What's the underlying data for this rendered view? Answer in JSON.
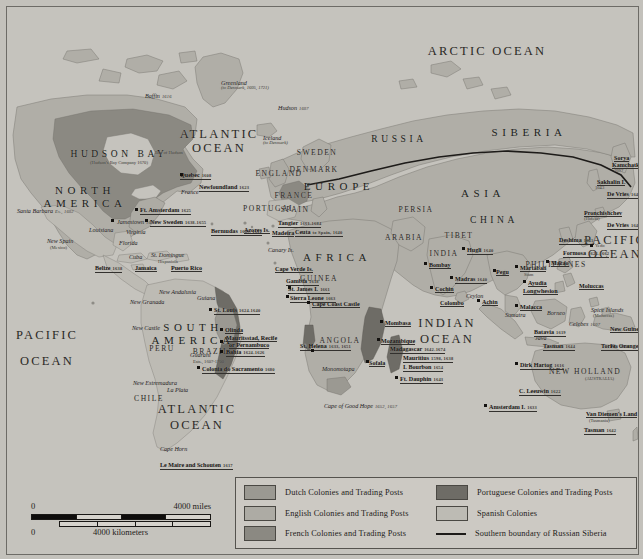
{
  "map": {
    "title": "European Colonies and Trading Posts c. 1700",
    "oceans": [
      {
        "name": "ARCTIC OCEAN",
        "x": 480,
        "y": 38,
        "size": "lg"
      },
      {
        "name": "ATLANTIC",
        "x": 212,
        "y": 121,
        "size": "lg"
      },
      {
        "name": "OCEAN",
        "x": 212,
        "y": 135,
        "size": "lg"
      },
      {
        "name": "PACIFIC",
        "x": 40,
        "y": 322,
        "size": "lg"
      },
      {
        "name": "OCEAN",
        "x": 40,
        "y": 348,
        "size": "lg"
      },
      {
        "name": "ATLANTIC",
        "x": 190,
        "y": 396,
        "size": "lg"
      },
      {
        "name": "OCEAN",
        "x": 190,
        "y": 412,
        "size": "lg"
      },
      {
        "name": "INDIAN",
        "x": 440,
        "y": 310,
        "size": "lg"
      },
      {
        "name": "OCEAN",
        "x": 440,
        "y": 326,
        "size": "lg"
      },
      {
        "name": "PACIFIC",
        "x": 608,
        "y": 227,
        "size": "lg"
      },
      {
        "name": "OCEAN",
        "x": 608,
        "y": 241,
        "size": "lg"
      }
    ],
    "continents": [
      {
        "name": "NORTH",
        "x": 78,
        "y": 178
      },
      {
        "name": "AMERICA",
        "x": 78,
        "y": 191
      },
      {
        "name": "SOUTH",
        "x": 186,
        "y": 315
      },
      {
        "name": "AMERICA",
        "x": 186,
        "y": 328
      },
      {
        "name": "AFRICA",
        "x": 330,
        "y": 245
      },
      {
        "name": "EUROPE",
        "x": 332,
        "y": 174
      },
      {
        "name": "ASIA",
        "x": 476,
        "y": 181
      },
      {
        "name": "SIBERIA",
        "x": 522,
        "y": 120
      },
      {
        "name": "CHINA",
        "x": 487,
        "y": 209
      },
      {
        "name": "RUSSIA",
        "x": 392,
        "y": 128
      },
      {
        "name": "HUDSON BAY",
        "x": 112,
        "y": 143
      }
    ],
    "regions": [
      {
        "name": "GUINEA",
        "x": 312,
        "y": 268
      },
      {
        "name": "ANGOLA",
        "x": 333,
        "y": 330
      },
      {
        "name": "ARABIA",
        "x": 397,
        "y": 227
      },
      {
        "name": "PERSIA",
        "x": 409,
        "y": 199
      },
      {
        "name": "INDIA",
        "x": 437,
        "y": 243
      },
      {
        "name": "PERU",
        "x": 155,
        "y": 338
      },
      {
        "name": "CHILE",
        "x": 142,
        "y": 388
      },
      {
        "name": "BRAZIL",
        "x": 204,
        "y": 341
      },
      {
        "name": "PHILIPPINES",
        "x": 549,
        "y": 254
      },
      {
        "name": "SWEDEN",
        "x": 310,
        "y": 142
      },
      {
        "name": "DENMARK",
        "x": 307,
        "y": 159
      },
      {
        "name": "ENGLAND",
        "x": 272,
        "y": 163
      },
      {
        "name": "FRANCE",
        "x": 287,
        "y": 185
      },
      {
        "name": "SPAIN",
        "x": 288,
        "y": 199
      },
      {
        "name": "PORTUGAL",
        "x": 262,
        "y": 198
      },
      {
        "name": "NEW HOLLAND",
        "x": 578,
        "y": 361
      },
      {
        "name": "TIBET",
        "x": 452,
        "y": 225
      }
    ],
    "places": [
      {
        "name": "Greenland",
        "x": 214,
        "y": 73,
        "type": "i",
        "sub": "(to Denmark, 1605, 1721)"
      },
      {
        "name": "Iceland",
        "x": 256,
        "y": 128,
        "type": "i",
        "sub": "(to Denmark)"
      },
      {
        "name": "Bay of Hudson",
        "x": 148,
        "y": 144,
        "type": "sub"
      },
      {
        "name": "Hudson",
        "x": 271,
        "y": 98,
        "type": "i",
        "date": "1607"
      },
      {
        "name": "Baffin",
        "x": 138,
        "y": 86,
        "type": "i",
        "date": "1616"
      },
      {
        "name": "Quebec",
        "x": 173,
        "y": 165,
        "type": "b",
        "date": "1608"
      },
      {
        "name": "France",
        "x": 174,
        "y": 182,
        "type": "i"
      },
      {
        "name": "Newfoundland",
        "x": 192,
        "y": 177,
        "type": "b",
        "date": "1623"
      },
      {
        "name": "Ft. Amsterdam",
        "x": 133,
        "y": 200,
        "type": "b",
        "date": "1625"
      },
      {
        "name": "New Sweden",
        "x": 143,
        "y": 212,
        "type": "b",
        "date": "1638-1655"
      },
      {
        "name": "Jamestown",
        "x": 110,
        "y": 212,
        "type": "i",
        "date": "1607"
      },
      {
        "name": "Virginia",
        "x": 119,
        "y": 222,
        "type": "i"
      },
      {
        "name": "Louisiana",
        "x": 82,
        "y": 220,
        "type": "i"
      },
      {
        "name": "Bermudas",
        "x": 204,
        "y": 221,
        "type": "b",
        "date": "1609, 1612"
      },
      {
        "name": "Azores Is.",
        "x": 237,
        "y": 220,
        "type": "b"
      },
      {
        "name": "Tangier",
        "x": 271,
        "y": 213,
        "type": "b",
        "date": "1661-1684"
      },
      {
        "name": "Madeira",
        "x": 265,
        "y": 223,
        "type": "b"
      },
      {
        "name": "Ceuta",
        "x": 288,
        "y": 222,
        "type": "b",
        "date": "to Spain, 1640"
      },
      {
        "name": "Canary Is.",
        "x": 261,
        "y": 240,
        "type": "i"
      },
      {
        "name": "Cape Verde Is.",
        "x": 268,
        "y": 259,
        "type": "b"
      },
      {
        "name": "Gambia",
        "x": 279,
        "y": 271,
        "type": "b",
        "date": "1618"
      },
      {
        "name": "St. James I.",
        "x": 281,
        "y": 279,
        "type": "b",
        "date": "1661"
      },
      {
        "name": "Sierra Leone",
        "x": 283,
        "y": 288,
        "type": "b",
        "date": "1663"
      },
      {
        "name": "Cape Coast Castle",
        "x": 305,
        "y": 294,
        "type": "b"
      },
      {
        "name": "Santa Barbara",
        "x": 10,
        "y": 201,
        "type": "i",
        "date": "Es., 1602"
      },
      {
        "name": "New Spain",
        "x": 40,
        "y": 231,
        "type": "i"
      },
      {
        "name": "(Mexico)",
        "x": 43,
        "y": 239,
        "type": "sub"
      },
      {
        "name": "Florida",
        "x": 112,
        "y": 233,
        "type": "i"
      },
      {
        "name": "Cuba",
        "x": 122,
        "y": 247,
        "type": "i"
      },
      {
        "name": "St. Domingue",
        "x": 144,
        "y": 245,
        "type": "i"
      },
      {
        "name": "Hispaniola",
        "x": 151,
        "y": 253,
        "type": "sub"
      },
      {
        "name": "Belize",
        "x": 88,
        "y": 258,
        "type": "b",
        "date": "1638"
      },
      {
        "name": "Jamaica",
        "x": 128,
        "y": 258,
        "type": "b"
      },
      {
        "name": "Puerto Rico",
        "x": 164,
        "y": 258,
        "type": "b"
      },
      {
        "name": "New Granada",
        "x": 123,
        "y": 292,
        "type": "i"
      },
      {
        "name": "New Andalusia",
        "x": 152,
        "y": 282,
        "type": "i"
      },
      {
        "name": "Guiana",
        "x": 190,
        "y": 288,
        "type": "i"
      },
      {
        "name": "New Castle",
        "x": 125,
        "y": 318,
        "type": "i"
      },
      {
        "name": "St. Louis",
        "x": 207,
        "y": 300,
        "type": "b",
        "date": "1624-1640"
      },
      {
        "name": "Olinda",
        "x": 218,
        "y": 320,
        "type": "b"
      },
      {
        "name": "Mauritsstad, Recife",
        "x": 219,
        "y": 328,
        "type": "b"
      },
      {
        "name": "or Pernambuco",
        "x": 222,
        "y": 335,
        "type": "b"
      },
      {
        "name": "Bahia",
        "x": 219,
        "y": 342,
        "type": "b",
        "date": "1624-1626"
      },
      {
        "name": "Colonia do Sacramento",
        "x": 195,
        "y": 359,
        "type": "b",
        "date": "1680"
      },
      {
        "name": "Guarani",
        "x": 183,
        "y": 345,
        "type": "i"
      },
      {
        "name": "Ests., 1607-1700",
        "x": 186,
        "y": 353,
        "type": "sub"
      },
      {
        "name": "La Plata",
        "x": 160,
        "y": 380,
        "type": "i"
      },
      {
        "name": "New Estremadura",
        "x": 126,
        "y": 373,
        "type": "i"
      },
      {
        "name": "Cape Horn",
        "x": 153,
        "y": 439,
        "type": "i"
      },
      {
        "name": "Le Maire and Schouten",
        "x": 153,
        "y": 455,
        "type": "b",
        "date": "1617"
      },
      {
        "name": "St. Helena",
        "x": 293,
        "y": 336,
        "type": "b",
        "date": "1633, 1651"
      },
      {
        "name": "Cape of Good Hope",
        "x": 317,
        "y": 396,
        "type": "i",
        "date": "1652, 1657"
      },
      {
        "name": "Monomotapa",
        "x": 315,
        "y": 359,
        "type": "i"
      },
      {
        "name": "Mombasa",
        "x": 378,
        "y": 313,
        "type": "b"
      },
      {
        "name": "Mozambique",
        "x": 374,
        "y": 331,
        "type": "b"
      },
      {
        "name": "Madagascar",
        "x": 383,
        "y": 339,
        "type": "b",
        "date": "1642-1674"
      },
      {
        "name": "Sofala",
        "x": 362,
        "y": 353,
        "type": "b"
      },
      {
        "name": "Mauritius",
        "x": 396,
        "y": 348,
        "type": "b",
        "date": "1598, 1638"
      },
      {
        "name": "I. Bourbon",
        "x": 396,
        "y": 357,
        "type": "b",
        "date": "1654"
      },
      {
        "name": "Ft. Dauphin",
        "x": 393,
        "y": 369,
        "type": "b",
        "date": "1643"
      },
      {
        "name": "Bombay",
        "x": 422,
        "y": 255,
        "type": "b"
      },
      {
        "name": "Hugli",
        "x": 460,
        "y": 240,
        "type": "b",
        "date": "1640"
      },
      {
        "name": "Madras",
        "x": 448,
        "y": 269,
        "type": "b",
        "date": "1640"
      },
      {
        "name": "Cochin",
        "x": 428,
        "y": 279,
        "type": "b"
      },
      {
        "name": "Colombo",
        "x": 433,
        "y": 293,
        "type": "b"
      },
      {
        "name": "Ceylon",
        "x": 459,
        "y": 286,
        "type": "i"
      },
      {
        "name": "Achin",
        "x": 475,
        "y": 292,
        "type": "b"
      },
      {
        "name": "Sumatra",
        "x": 498,
        "y": 305,
        "type": "i"
      },
      {
        "name": "Malacca",
        "x": 513,
        "y": 297,
        "type": "b"
      },
      {
        "name": "Borneo",
        "x": 540,
        "y": 303,
        "type": "i"
      },
      {
        "name": "Celebes",
        "x": 562,
        "y": 314,
        "type": "i",
        "date": "1607"
      },
      {
        "name": "Java",
        "x": 528,
        "y": 328,
        "type": "i"
      },
      {
        "name": "Batavia",
        "x": 527,
        "y": 322,
        "type": "b",
        "date": "1619"
      },
      {
        "name": "Spice Islands",
        "x": 584,
        "y": 300,
        "type": "i"
      },
      {
        "name": "(Moluccas)",
        "x": 586,
        "y": 307,
        "type": "sub"
      },
      {
        "name": "Moluccas",
        "x": 572,
        "y": 276,
        "type": "b"
      },
      {
        "name": "Pegu",
        "x": 489,
        "y": 262,
        "type": "b"
      },
      {
        "name": "Martaban",
        "x": 513,
        "y": 258,
        "type": "b"
      },
      {
        "name": "Siam",
        "x": 517,
        "y": 266,
        "type": "sub"
      },
      {
        "name": "Ayudia",
        "x": 521,
        "y": 273,
        "type": "b"
      },
      {
        "name": "Longwhesion",
        "x": 516,
        "y": 281,
        "type": "b"
      },
      {
        "name": "Macao",
        "x": 544,
        "y": 253,
        "type": "b"
      },
      {
        "name": "Deshima",
        "x": 552,
        "y": 230,
        "type": "b",
        "date": "1641"
      },
      {
        "name": "Formosa",
        "x": 556,
        "y": 243,
        "type": "b",
        "date": "1624-1662"
      },
      {
        "name": "Yedo",
        "x": 588,
        "y": 237,
        "type": "sub"
      },
      {
        "name": "De Vries",
        "x": 600,
        "y": 184,
        "type": "b",
        "date": "1643"
      },
      {
        "name": "De Vries",
        "x": 600,
        "y": 215,
        "type": "b",
        "date": "1643"
      },
      {
        "name": "Sakhalin I.",
        "x": 590,
        "y": 172,
        "type": "b"
      },
      {
        "name": "1643",
        "x": 588,
        "y": 179,
        "type": "sub"
      },
      {
        "name": "Sorya",
        "x": 607,
        "y": 148,
        "type": "b"
      },
      {
        "name": "Kamchatka",
        "x": 605,
        "y": 155,
        "type": "b"
      },
      {
        "name": "1697",
        "x": 607,
        "y": 162,
        "type": "sub"
      },
      {
        "name": "Pronchishchev",
        "x": 577,
        "y": 203,
        "type": "b"
      },
      {
        "name": "(Hideki)",
        "x": 577,
        "y": 210,
        "type": "sub"
      },
      {
        "name": "New Guinea",
        "x": 603,
        "y": 319,
        "type": "b"
      },
      {
        "name": "Torres",
        "x": 594,
        "y": 336,
        "type": "b",
        "date": "1606"
      },
      {
        "name": "Tasman",
        "x": 536,
        "y": 336,
        "type": "b",
        "date": "1644"
      },
      {
        "name": "(AUSTRALIA)",
        "x": 578,
        "y": 370,
        "type": "sub"
      },
      {
        "name": "Dirk Hartog",
        "x": 513,
        "y": 355,
        "type": "b",
        "date": "1616"
      },
      {
        "name": "C. Leeuwin",
        "x": 512,
        "y": 381,
        "type": "b",
        "date": "1622"
      },
      {
        "name": "Amsterdam I.",
        "x": 482,
        "y": 397,
        "type": "b",
        "date": "1633"
      },
      {
        "name": "Van Diemen's Land",
        "x": 579,
        "y": 404,
        "type": "b"
      },
      {
        "name": "(Tasmania)",
        "x": 582,
        "y": 412,
        "type": "sub"
      },
      {
        "name": "Tasman",
        "x": 577,
        "y": 420,
        "type": "b",
        "date": "1642"
      },
      {
        "name": "Ft. Orange",
        "x": 603,
        "y": 336,
        "type": "b",
        "date": "1642"
      }
    ],
    "dots": [
      {
        "x": 128,
        "y": 201
      },
      {
        "x": 138,
        "y": 212
      },
      {
        "x": 104,
        "y": 212
      },
      {
        "x": 202,
        "y": 301
      },
      {
        "x": 213,
        "y": 321
      },
      {
        "x": 213,
        "y": 333
      },
      {
        "x": 213,
        "y": 343
      },
      {
        "x": 190,
        "y": 359
      },
      {
        "x": 300,
        "y": 294
      },
      {
        "x": 304,
        "y": 342
      },
      {
        "x": 373,
        "y": 313
      },
      {
        "x": 370,
        "y": 331
      },
      {
        "x": 359,
        "y": 353
      },
      {
        "x": 388,
        "y": 369
      },
      {
        "x": 417,
        "y": 255
      },
      {
        "x": 455,
        "y": 240
      },
      {
        "x": 443,
        "y": 269
      },
      {
        "x": 423,
        "y": 279
      },
      {
        "x": 470,
        "y": 292
      },
      {
        "x": 508,
        "y": 297
      },
      {
        "x": 539,
        "y": 253
      },
      {
        "x": 486,
        "y": 262
      },
      {
        "x": 508,
        "y": 258
      },
      {
        "x": 516,
        "y": 273
      },
      {
        "x": 583,
        "y": 237
      },
      {
        "x": 508,
        "y": 355
      },
      {
        "x": 477,
        "y": 397
      },
      {
        "x": 173,
        "y": 166
      },
      {
        "x": 281,
        "y": 279
      },
      {
        "x": 279,
        "y": 288
      }
    ]
  },
  "legend": {
    "items_left": [
      {
        "label": "Dutch Colonies and Trading Posts",
        "color": "#9b9992",
        "swatch": true
      },
      {
        "label": "English Colonies and Trading Posts",
        "color": "#adaba4",
        "swatch": true
      },
      {
        "label": "French Colonies and Trading Posts",
        "color": "#8b8982",
        "swatch": true
      }
    ],
    "items_right": [
      {
        "label": "Portuguese Colonies and Trading Posts",
        "color": "#6e6c66",
        "swatch": true
      },
      {
        "label": "Spanish Colonies",
        "color": "#bdbbb4",
        "swatch": true
      },
      {
        "label": "Southern boundary of Russian Siberia",
        "color": "#1d1b19",
        "swatch": false
      }
    ]
  },
  "scale": {
    "miles_zero": "0",
    "miles_max": "4000 miles",
    "km_zero": "0",
    "km_max": "4000 kilometers"
  },
  "colors": {
    "ocean": "#c5c3bd",
    "land": "#b0aea7",
    "dutch": "#9b9992",
    "english": "#adaba4",
    "french": "#8b8982",
    "portuguese": "#6e6c66",
    "spanish": "#bdbbb4",
    "border": "#6d6b66",
    "text": "#23211e"
  }
}
